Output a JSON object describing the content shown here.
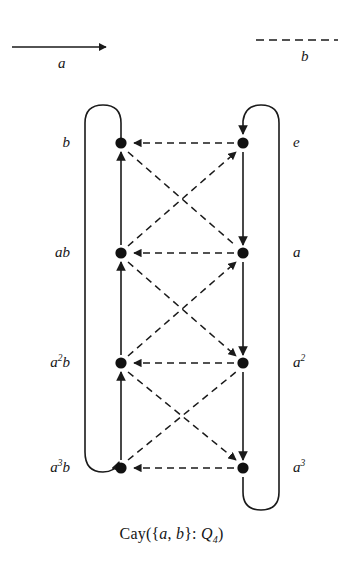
{
  "figure": {
    "caption_prefix": "Cay({",
    "caption_gen_a": "a",
    "caption_sep": ", ",
    "caption_gen_b": "b",
    "caption_mid": "}: ",
    "caption_group": "Q",
    "caption_group_sub": "4",
    "caption_suffix": ")"
  },
  "legend": {
    "items": [
      {
        "name": "a",
        "label": "a",
        "style": "solid",
        "arrow": "right",
        "description": "solid arrow generator a"
      },
      {
        "name": "b",
        "label": "b",
        "style": "dashed",
        "arrow": "none",
        "description": "dashed line generator b"
      }
    ],
    "a_label": "a",
    "b_label": "b"
  },
  "graph": {
    "name": "Cayley graph of Q4 with generators a and b",
    "left_column": {
      "labels": [
        "b",
        "ab",
        "a2b",
        "a3b"
      ],
      "display": [
        {
          "base": "b",
          "sup": ""
        },
        {
          "base": "ab",
          "sup": ""
        },
        {
          "base": "a",
          "sup": "2",
          "tail": "b"
        },
        {
          "base": "a",
          "sup": "3",
          "tail": "b"
        }
      ]
    },
    "right_column": {
      "labels": [
        "e",
        "a",
        "a2",
        "a3"
      ],
      "display": [
        {
          "base": "e",
          "sup": ""
        },
        {
          "base": "a",
          "sup": ""
        },
        {
          "base": "a",
          "sup": "2"
        },
        {
          "base": "a",
          "sup": "3"
        }
      ]
    },
    "vertex_labels_left": [
      "b",
      "ab",
      "a²b",
      "a³b"
    ],
    "vertex_labels_right": [
      "e",
      "a",
      "a²",
      "a³"
    ],
    "vertex_count": 8,
    "colors": {
      "edge": "#1a1a1a",
      "vertex": "#111111",
      "background": "#ffffff"
    }
  }
}
